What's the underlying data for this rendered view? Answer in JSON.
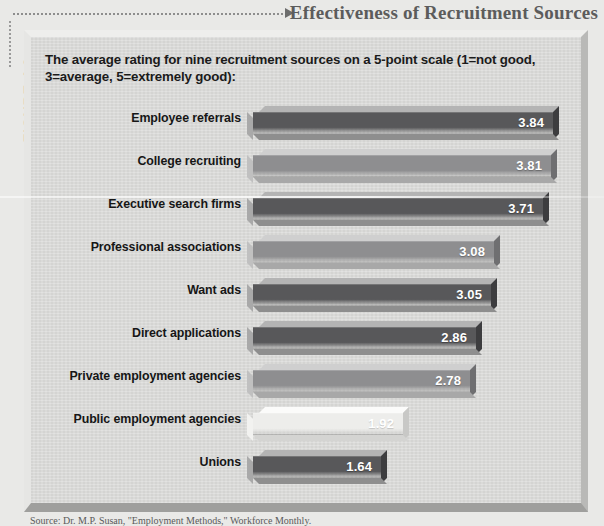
{
  "figure": {
    "number_label": "FIGURE 4.9",
    "title": "Effectiveness of Recruitment Sources",
    "caption": "The average rating for nine recruitment sources on a 5-point scale (1=not good, 3=average, 5=extremely good):",
    "source_note": "Source: Dr. M.P. Susan, \"Employment Methods,\" Workforce Monthly."
  },
  "colors": {
    "panel_background": "#d8d8d6",
    "page_background": "#e9e9e7",
    "bar_dark": "#58585a",
    "bar_medium": "#8e8e90",
    "bar_light": "#ededeb",
    "title_text": "#5c5c5c",
    "value_text": "#ffffff"
  },
  "chart_data": {
    "type": "bar",
    "title": "Effectiveness of Recruitment Sources",
    "subtitle": "The average rating for nine recruitment sources on a 5-point scale (1=not good, 3=average, 5=extremely good):",
    "orientation": "horizontal",
    "xlabel": "",
    "ylabel": "",
    "xlim": [
      0,
      4.0
    ],
    "grid": false,
    "legend": false,
    "scale_note": "5-point scale: 1=not good, 3=average, 5=extremely good",
    "categories": [
      "Employee referrals",
      "College recruiting",
      "Executive search firms",
      "Professional associations",
      "Want ads",
      "Direct applications",
      "Private employment agencies",
      "Public employment agencies",
      "Unions"
    ],
    "values": [
      3.84,
      3.81,
      3.71,
      3.08,
      3.05,
      2.86,
      2.78,
      1.92,
      1.64
    ],
    "value_labels": [
      "3.84",
      "3.81",
      "3.71",
      "3.08",
      "3.05",
      "2.86",
      "2.78",
      "1.92",
      "1.64"
    ],
    "bar_shades": [
      "dark",
      "medium",
      "dark",
      "medium",
      "dark",
      "dark",
      "medium",
      "light",
      "dark"
    ]
  }
}
